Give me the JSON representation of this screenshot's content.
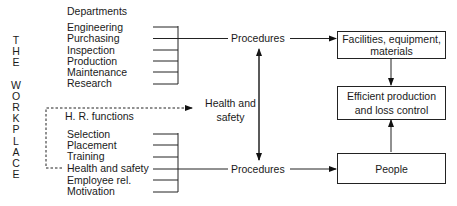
{
  "side_label": [
    "T",
    "H",
    "E",
    "",
    "W",
    "O",
    "R",
    "K",
    "P",
    "L",
    "A",
    "C",
    "E"
  ],
  "departments": {
    "heading": "Departments",
    "items": [
      "Engineering",
      "Purchasing",
      "Inspection",
      "Production",
      "Maintenance",
      "Research"
    ]
  },
  "hr": {
    "heading": "H. R. functions",
    "items": [
      "Selection",
      "Placement",
      "Training",
      "Health and safety",
      "Employee rel.",
      "Motivation"
    ]
  },
  "nodes": {
    "procedures_top": "Procedures",
    "procedures_bottom": "Procedures",
    "health_safety_line1": "Health and",
    "health_safety_line2": "safety",
    "facilities_line1": "Facilities, equipment,",
    "facilities_line2": "materials",
    "efficient_line1": "Efficient production",
    "efficient_line2": "and loss control",
    "people": "People"
  }
}
